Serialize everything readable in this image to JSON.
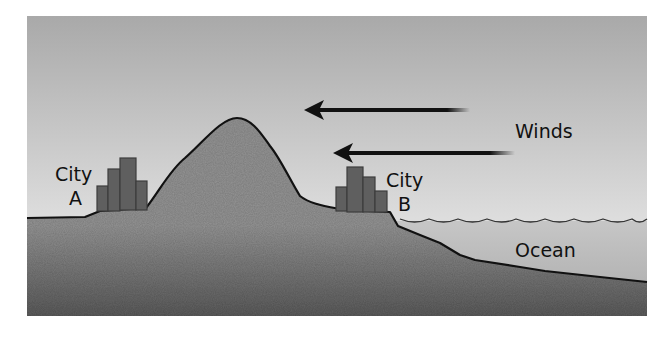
{
  "diagram": {
    "labels": {
      "winds": "Winds",
      "ocean": "Ocean",
      "city_a_line1": "City",
      "city_a_line2": "A",
      "city_b_line1": "City",
      "city_b_line2": "B"
    },
    "arrows": [
      {
        "name": "wind-arrow-upper",
        "direction": "left"
      },
      {
        "name": "wind-arrow-lower",
        "direction": "left"
      }
    ],
    "colors": {
      "sky_top": "#a9a9a9",
      "sky_bottom": "#f6f6f6",
      "ground_top": "#949494",
      "ground_bottom": "#5c5c5c",
      "ocean": "#b4b4b4",
      "building_fill": "#5f5f5f",
      "building_stroke": "#3c3c3c",
      "outline": "#111111"
    }
  }
}
